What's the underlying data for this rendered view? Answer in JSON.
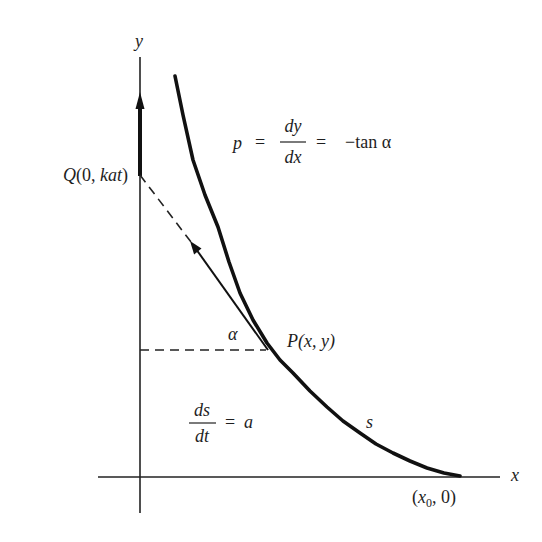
{
  "figure": {
    "axes": {
      "y_label": "y",
      "x_label": "x"
    },
    "points": {
      "Q": {
        "name": "Q",
        "open": "(0, ",
        "coord": "kat",
        "close": ")"
      },
      "P": {
        "name": "P",
        "text": "(x, y)"
      },
      "x0": {
        "open": "(x",
        "sub": "0",
        "close": ", 0)"
      }
    },
    "equations": {
      "slope": {
        "lhs": "p",
        "eq1": "=",
        "num": "dy",
        "den": "dx",
        "eq2": "=",
        "rhs": "−tan α"
      },
      "speed": {
        "num": "ds",
        "den": "dt",
        "eq": "=",
        "rhs": "a"
      }
    },
    "annotations": {
      "angle": "α",
      "arc_length": "s"
    },
    "colors": {
      "ink": "#1e1e1e",
      "background": "#ffffff"
    }
  }
}
